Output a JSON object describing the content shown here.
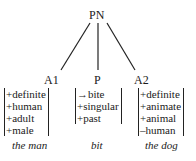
{
  "root": {
    "label": "PN"
  },
  "children": [
    {
      "label": "A1",
      "features": [
        "+definite",
        "+human",
        "+adult",
        "+male"
      ],
      "gloss": "the man"
    },
    {
      "label": "P",
      "features": [
        "→bite",
        "+singular",
        "+past"
      ],
      "gloss": "bit"
    },
    {
      "label": "A2",
      "features": [
        "+definite",
        "+animate",
        "+animal",
        "–human"
      ],
      "gloss": "the dog"
    }
  ],
  "colors": {
    "line": "#222222",
    "text": "#1a1a1a"
  }
}
